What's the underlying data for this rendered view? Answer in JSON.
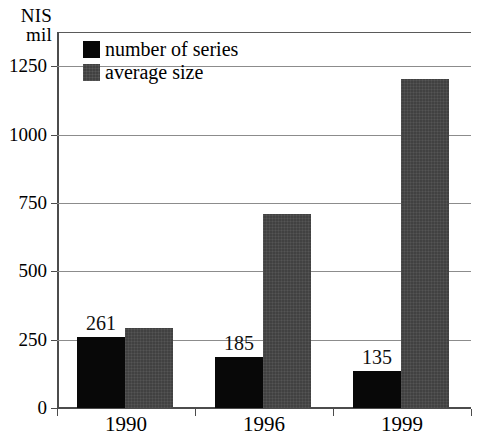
{
  "chart_data": {
    "type": "bar",
    "title": "",
    "subtitle": "",
    "xlabel": "",
    "ylabel": "NIS mil",
    "ylabel_line1": "NIS",
    "ylabel_line2": "mil",
    "categories": [
      "1990",
      "1996",
      "1999"
    ],
    "series": [
      {
        "name": "number of series",
        "color": "#080808",
        "values": [
          261,
          185,
          135
        ]
      },
      {
        "name": "average size",
        "color": "#414141",
        "values": [
          292,
          710,
          1205
        ]
      }
    ],
    "data_labels": [
      "261",
      "185",
      "135"
    ],
    "ylim": [
      0,
      1375
    ],
    "yticks": [
      0,
      250,
      500,
      750,
      1000,
      1250
    ],
    "ytick_labels": [
      "0",
      "250",
      "500",
      "750",
      "1000",
      "1250"
    ],
    "grid": true,
    "grid_axis": "y",
    "legend_position": "top-left-inside",
    "legend_frame": false
  }
}
